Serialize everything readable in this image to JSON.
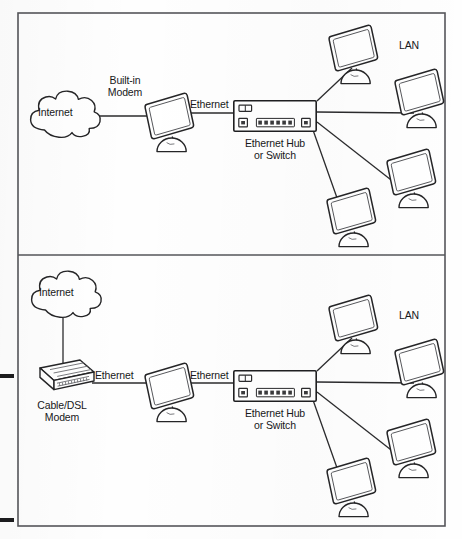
{
  "figure": {
    "type": "network-topology-diagram",
    "panel_count": 2,
    "frame": {
      "x": 18,
      "y": 13,
      "width": 427,
      "height": 513,
      "divider_y": 255,
      "stroke": "#55565a"
    },
    "ink_color": "#1c1c1e",
    "line_color": "#2b2b2d",
    "page_marks": [
      {
        "name": "left-edge-tick-upper",
        "x": 0,
        "y": 374,
        "width": 14,
        "height": 4
      },
      {
        "name": "left-edge-tick-lower",
        "x": 0,
        "y": 518,
        "width": 14,
        "height": 4
      }
    ]
  },
  "panels": [
    {
      "id": "panel-top",
      "name": "built-in-modem-topology",
      "caption_order": [
        "Internet",
        "Built-in Modem",
        "Ethernet",
        "Ethernet Hub or Switch",
        "LAN"
      ],
      "nodes": [
        {
          "name": "internet-cloud",
          "label": "Internet",
          "type": "cloud",
          "x": 26,
          "y": 88,
          "width": 76,
          "height": 50
        },
        {
          "name": "gateway-computer",
          "label": "",
          "type": "computer",
          "x": 143,
          "y": 92,
          "width": 52,
          "height": 60
        },
        {
          "name": "ethernet-hub",
          "label": "Ethernet Hub\nor Switch",
          "type": "hub",
          "x": 233,
          "y": 100,
          "width": 84,
          "height": 32
        },
        {
          "name": "lan-computer-1",
          "label": "",
          "type": "computer",
          "x": 327,
          "y": 24,
          "width": 52,
          "height": 60
        },
        {
          "name": "lan-computer-2",
          "label": "",
          "type": "computer",
          "x": 393,
          "y": 68,
          "width": 52,
          "height": 60
        },
        {
          "name": "lan-computer-3",
          "label": "",
          "type": "computer",
          "x": 385,
          "y": 148,
          "width": 52,
          "height": 60
        },
        {
          "name": "lan-computer-4",
          "label": "",
          "type": "computer",
          "x": 325,
          "y": 187,
          "width": 52,
          "height": 60
        }
      ],
      "links": [
        {
          "name": "link-internet-to-computer",
          "label": "Built-in\nModem",
          "from": "internet-cloud",
          "to": "gateway-computer"
        },
        {
          "name": "link-computer-to-hub",
          "label": "Ethernet",
          "from": "gateway-computer",
          "to": "ethernet-hub"
        },
        {
          "name": "link-hub-to-lan-1",
          "label": "",
          "from": "ethernet-hub",
          "to": "lan-computer-1"
        },
        {
          "name": "link-hub-to-lan-2",
          "label": "",
          "from": "ethernet-hub",
          "to": "lan-computer-2"
        },
        {
          "name": "link-hub-to-lan-3",
          "label": "",
          "from": "ethernet-hub",
          "to": "lan-computer-3"
        },
        {
          "name": "link-hub-to-lan-4",
          "label": "",
          "from": "ethernet-hub",
          "to": "lan-computer-4"
        }
      ],
      "labels": {
        "internet": "Internet",
        "modem_line1": "Built-in",
        "modem_line2": "Modem",
        "ethernet_right": "Ethernet",
        "hub_line1": "Ethernet Hub",
        "hub_line2": "or Switch",
        "lan": "LAN"
      }
    },
    {
      "id": "panel-bottom",
      "name": "external-cable-dsl-modem-topology",
      "caption_order": [
        "Internet",
        "Cable/DSL Modem",
        "Ethernet",
        "Ethernet",
        "Ethernet Hub or Switch",
        "LAN"
      ],
      "nodes": [
        {
          "name": "internet-cloud",
          "label": "Internet",
          "type": "cloud",
          "x": 27,
          "y": 268,
          "width": 76,
          "height": 50
        },
        {
          "name": "cable-dsl-modem",
          "label": "Cable/DSL\nModem",
          "type": "modem-box",
          "x": 28,
          "y": 358,
          "width": 66,
          "height": 38
        },
        {
          "name": "gateway-computer",
          "label": "",
          "type": "computer",
          "x": 143,
          "y": 362,
          "width": 52,
          "height": 60
        },
        {
          "name": "ethernet-hub",
          "label": "Ethernet Hub\nor Switch",
          "type": "hub",
          "x": 233,
          "y": 370,
          "width": 84,
          "height": 32
        },
        {
          "name": "lan-computer-1",
          "label": "",
          "type": "computer",
          "x": 327,
          "y": 294,
          "width": 52,
          "height": 60
        },
        {
          "name": "lan-computer-2",
          "label": "",
          "type": "computer",
          "x": 393,
          "y": 338,
          "width": 52,
          "height": 60
        },
        {
          "name": "lan-computer-3",
          "label": "",
          "type": "computer",
          "x": 385,
          "y": 418,
          "width": 52,
          "height": 60
        },
        {
          "name": "lan-computer-4",
          "label": "",
          "type": "computer",
          "x": 325,
          "y": 457,
          "width": 52,
          "height": 60
        }
      ],
      "links": [
        {
          "name": "link-internet-to-modem",
          "label": "",
          "from": "internet-cloud",
          "to": "cable-dsl-modem"
        },
        {
          "name": "link-modem-to-computer",
          "label": "Ethernet",
          "from": "cable-dsl-modem",
          "to": "gateway-computer"
        },
        {
          "name": "link-computer-to-hub",
          "label": "Ethernet",
          "from": "gateway-computer",
          "to": "ethernet-hub"
        },
        {
          "name": "link-hub-to-lan-1",
          "label": "",
          "from": "ethernet-hub",
          "to": "lan-computer-1"
        },
        {
          "name": "link-hub-to-lan-2",
          "label": "",
          "from": "ethernet-hub",
          "to": "lan-computer-2"
        },
        {
          "name": "link-hub-to-lan-3",
          "label": "",
          "from": "ethernet-hub",
          "to": "lan-computer-3"
        },
        {
          "name": "link-hub-to-lan-4",
          "label": "",
          "from": "ethernet-hub",
          "to": "lan-computer-4"
        }
      ],
      "labels": {
        "internet": "Internet",
        "modem_line1": "Cable/DSL",
        "modem_line2": "Modem",
        "ethernet_left": "Ethernet",
        "ethernet_right": "Ethernet",
        "hub_line1": "Ethernet Hub",
        "hub_line2": "or Switch",
        "lan": "LAN"
      }
    }
  ],
  "hub_device": {
    "name": "ethernet-hub-switch",
    "led_count": 1,
    "uplink_ports": 1,
    "center_ports": 6,
    "aux_ports": 1,
    "port_total": 8
  }
}
